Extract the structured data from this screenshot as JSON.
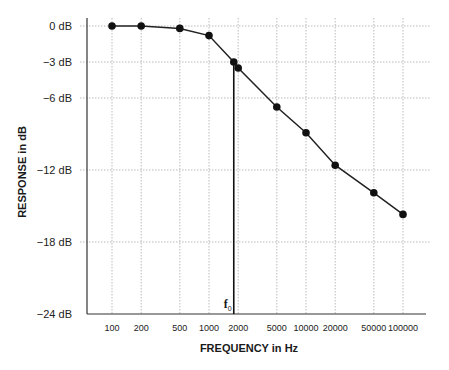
{
  "chart_data": {
    "type": "line",
    "title": "",
    "xlabel": "FREQUENCY in Hz",
    "ylabel": "RESPONSE in dB",
    "x_scale": "log",
    "xlim": [
      100,
      100000
    ],
    "ylim": [
      -24,
      0
    ],
    "grid": true,
    "legend": null,
    "x_ticks": [
      "100",
      "200",
      "500",
      "1000",
      "2000",
      "5000",
      "10000",
      "20000",
      "50000",
      "100000"
    ],
    "y_ticks": [
      "0 dB",
      "−3 dB",
      "−6 dB",
      "−12 dB",
      "−18 dB",
      "−24 dB"
    ],
    "y_tick_values": [
      0,
      -3,
      -6,
      -12,
      -18,
      -24
    ],
    "series": [
      {
        "name": "Response",
        "x": [
          100,
          200,
          500,
          1000,
          1800,
          2000,
          5000,
          10000,
          20000,
          50000,
          100000
        ],
        "values": [
          0,
          0,
          -0.2,
          -0.8,
          -3,
          -3.5,
          -6.75,
          -8.9,
          -11.6,
          -13.9,
          -15.7
        ]
      }
    ],
    "annotations": [
      {
        "text": "f0",
        "label_main": "f",
        "label_sub": "0",
        "x": 1800,
        "y": -3,
        "description": "cutoff frequency marker with vertical line down to x-axis"
      }
    ]
  }
}
